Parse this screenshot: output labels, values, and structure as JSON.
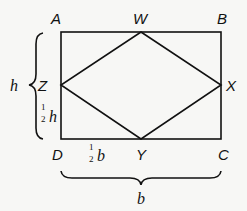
{
  "diagram": {
    "vertices": {
      "A": {
        "label": "A",
        "x": 61,
        "y": 32
      },
      "B": {
        "label": "B",
        "x": 221,
        "y": 32
      },
      "C": {
        "label": "C",
        "x": 221,
        "y": 139
      },
      "D": {
        "label": "D",
        "x": 61,
        "y": 139
      },
      "W": {
        "label": "W",
        "x": 141,
        "y": 32
      },
      "X": {
        "label": "X",
        "x": 221,
        "y": 85
      },
      "Y": {
        "label": "Y",
        "x": 141,
        "y": 139
      },
      "Z": {
        "label": "Z",
        "x": 61,
        "y": 85
      }
    },
    "dimensions": {
      "height_label": "h",
      "half_height_num": "1",
      "half_height_den": "2",
      "half_height_var": "h",
      "width_label": "b",
      "half_width_num": "1",
      "half_width_den": "2",
      "half_width_var": "b"
    },
    "colors": {
      "line": "#111111",
      "background": "#f7f7f5"
    }
  }
}
